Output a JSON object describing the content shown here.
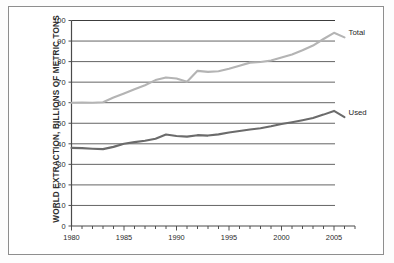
{
  "chart_data": {
    "type": "line",
    "title": "",
    "xlabel": "",
    "ylabel": "WORLD EXTRACTION, BILLIONS OF METRIC TONS",
    "xlim": [
      1980,
      2007
    ],
    "ylim": [
      0,
      100
    ],
    "ytick_step": 10,
    "yticks": [
      0,
      10,
      20,
      30,
      40,
      50,
      60,
      70,
      80,
      90,
      100
    ],
    "ytick_labels": [
      "0",
      "10",
      "20",
      "30",
      "40",
      "50",
      "60",
      "70",
      "80",
      "90",
      "100"
    ],
    "xticks": [
      1980,
      1985,
      1990,
      1995,
      2000,
      2005
    ],
    "xtick_labels": [
      "1980",
      "1985",
      "1990",
      "1995",
      "2000",
      "2005"
    ],
    "x_minor_tick_step": 1,
    "grid": "horizontal",
    "legend_position": "inline-right-of-line-end",
    "x": [
      1980,
      1981,
      1982,
      1983,
      1984,
      1985,
      1986,
      1987,
      1988,
      1989,
      1990,
      1991,
      1992,
      1993,
      1994,
      1995,
      1996,
      1997,
      1998,
      1999,
      2000,
      2001,
      2002,
      2003,
      2004,
      2005,
      2006
    ],
    "series": [
      {
        "name": "Total",
        "color": "#b4b4b4",
        "label": "Total",
        "values": [
          60.0,
          60.1,
          60.0,
          60.2,
          62.5,
          64.5,
          66.5,
          68.5,
          71.0,
          72.3,
          71.8,
          70.2,
          75.5,
          75.0,
          75.3,
          76.5,
          78.0,
          79.5,
          79.8,
          80.5,
          82.0,
          83.5,
          85.5,
          87.8,
          91.0,
          94.0,
          91.8
        ]
      },
      {
        "name": "Used",
        "color": "#6b6b6b",
        "label": "Used",
        "values": [
          38.0,
          37.9,
          37.6,
          37.4,
          38.5,
          40.0,
          40.8,
          41.5,
          42.5,
          44.5,
          43.8,
          43.5,
          44.2,
          44.0,
          44.6,
          45.5,
          46.2,
          47.0,
          47.6,
          48.5,
          49.6,
          50.5,
          51.5,
          52.6,
          54.2,
          56.0,
          53.0
        ]
      }
    ]
  },
  "figure": {
    "border_color": "#8e8e8e",
    "background": "#ffffff"
  }
}
